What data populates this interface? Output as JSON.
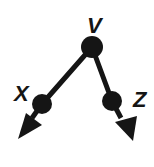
{
  "diagram": {
    "type": "tree",
    "colors": {
      "stroke": "#151515",
      "background": "#ffffff"
    },
    "nodes": [
      {
        "id": "V",
        "label": "V",
        "x": 92,
        "y": 47,
        "r": 11
      },
      {
        "id": "X",
        "label": "X",
        "x": 42,
        "y": 104,
        "r": 10
      },
      {
        "id": "Z",
        "label": "Z",
        "x": 112,
        "y": 101,
        "r": 10
      }
    ],
    "edges": [
      {
        "from": "V",
        "to": "X"
      },
      {
        "from": "V",
        "to": "Z"
      }
    ],
    "arrows": [
      {
        "from": "X",
        "direction": "down-left"
      },
      {
        "from": "Z",
        "direction": "down-right"
      }
    ]
  }
}
